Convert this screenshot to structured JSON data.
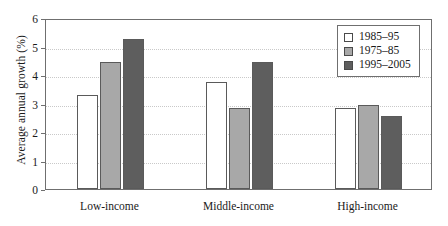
{
  "chart_data": {
    "type": "bar",
    "title": "",
    "xlabel": "",
    "ylabel": "Average annual growth (%)",
    "ylim": [
      0,
      6
    ],
    "yticks": [
      0,
      1,
      2,
      3,
      4,
      5,
      6
    ],
    "ytick_labels": [
      "0",
      "1",
      "2",
      "3",
      "4",
      "5",
      "6"
    ],
    "grid": true,
    "grid_axis": "y",
    "legend_position": "top-right",
    "categories": [
      "Low-income",
      "Middle-income",
      "High-income"
    ],
    "series": [
      {
        "name": "1985–95",
        "color": "#ffffff",
        "values": [
          3.3,
          3.75,
          2.85
        ]
      },
      {
        "name": "1975–85",
        "color": "#a8a8a8",
        "values": [
          4.45,
          2.85,
          2.95
        ]
      },
      {
        "name": "1995–2005",
        "color": "#5e5e5e",
        "values": [
          5.25,
          4.45,
          2.55
        ]
      }
    ]
  },
  "colors": {
    "axis": "#6f6f6f",
    "grid": "#c9c9c9",
    "text": "#1a1a1a",
    "bar_edge": "#5a5a5a",
    "series_1985_95": "#ffffff",
    "series_1975_85": "#a8a8a8",
    "series_1995_2005": "#5e5e5e"
  }
}
